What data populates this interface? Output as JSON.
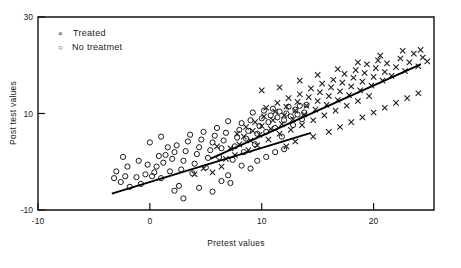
{
  "chart_data": {
    "type": "scatter",
    "title": "",
    "xlabel": "Pretest values",
    "ylabel": "Post test values",
    "xlim": [
      -10,
      25.4
    ],
    "ylim": [
      -10,
      30
    ],
    "xticks": [
      -10,
      0,
      10,
      20
    ],
    "xtick_labels": [
      "-10",
      "0",
      "10",
      "20"
    ],
    "yticks": [
      -10,
      10,
      30
    ],
    "ytick_labels": [
      "-10",
      "10",
      "30"
    ],
    "grid": false,
    "legend_position": "upper-left",
    "legend": [
      {
        "marker": "x",
        "label": "Treated"
      },
      {
        "marker": "o",
        "label": "No treatmet"
      }
    ],
    "series": [
      {
        "name": "No treatmet",
        "marker": "o",
        "color": "#1a1a1a",
        "points": [
          [
            -3.0,
            -2.0
          ],
          [
            -2.6,
            -4.2
          ],
          [
            -2.2,
            -3.0
          ],
          [
            -1.8,
            -5.2
          ],
          [
            -3.2,
            -3.4
          ],
          [
            -2.0,
            -1.0
          ],
          [
            -1.2,
            -3.2
          ],
          [
            -0.8,
            -4.6
          ],
          [
            -0.4,
            -2.6
          ],
          [
            -0.2,
            -0.6
          ],
          [
            0.2,
            -3.0
          ],
          [
            0.4,
            -2.2
          ],
          [
            0.6,
            -1.0
          ],
          [
            0.8,
            1.2
          ],
          [
            1.0,
            -3.4
          ],
          [
            1.2,
            -0.2
          ],
          [
            1.4,
            1.4
          ],
          [
            1.6,
            3.0
          ],
          [
            1.8,
            -2.0
          ],
          [
            2.0,
            0.6
          ],
          [
            2.2,
            2.0
          ],
          [
            2.4,
            3.4
          ],
          [
            2.6,
            -5.0
          ],
          [
            2.8,
            -1.6
          ],
          [
            3.0,
            0.2
          ],
          [
            3.2,
            2.2
          ],
          [
            3.4,
            4.2
          ],
          [
            3.6,
            5.6
          ],
          [
            3.8,
            -2.4
          ],
          [
            4.0,
            -0.4
          ],
          [
            4.2,
            1.6
          ],
          [
            4.4,
            3.0
          ],
          [
            4.6,
            4.6
          ],
          [
            4.8,
            6.2
          ],
          [
            5.0,
            -1.2
          ],
          [
            5.2,
            0.8
          ],
          [
            5.4,
            2.4
          ],
          [
            5.6,
            4.0
          ],
          [
            5.8,
            5.4
          ],
          [
            6.0,
            7.0
          ],
          [
            6.2,
            1.0
          ],
          [
            6.4,
            2.8
          ],
          [
            6.6,
            4.4
          ],
          [
            6.8,
            6.0
          ],
          [
            7.0,
            8.4
          ],
          [
            7.2,
            -4.4
          ],
          [
            7.4,
            0.4
          ],
          [
            7.6,
            3.2
          ],
          [
            7.8,
            5.0
          ],
          [
            8.0,
            6.6
          ],
          [
            8.2,
            8.0
          ],
          [
            8.4,
            2.0
          ],
          [
            8.6,
            4.8
          ],
          [
            8.8,
            6.4
          ],
          [
            9.0,
            8.6
          ],
          [
            9.2,
            10.2
          ],
          [
            9.4,
            3.6
          ],
          [
            9.6,
            5.8
          ],
          [
            9.8,
            7.4
          ],
          [
            10.0,
            9.0
          ],
          [
            10.2,
            10.6
          ],
          [
            10.4,
            6.2
          ],
          [
            10.6,
            8.2
          ],
          [
            10.8,
            9.6
          ],
          [
            11.0,
            11.0
          ],
          [
            11.2,
            7.0
          ],
          [
            11.4,
            9.2
          ],
          [
            11.6,
            10.4
          ],
          [
            11.8,
            5.2
          ],
          [
            12.0,
            8.6
          ],
          [
            12.2,
            10.0
          ],
          [
            12.4,
            11.4
          ],
          [
            12.6,
            9.4
          ],
          [
            12.8,
            7.6
          ],
          [
            13.0,
            10.8
          ],
          [
            13.2,
            9.8
          ],
          [
            13.4,
            11.6
          ],
          [
            13.6,
            8.8
          ],
          [
            13.8,
            10.2
          ],
          [
            14.0,
            11.8
          ],
          [
            0.0,
            4.0
          ],
          [
            1.0,
            5.2
          ],
          [
            -1.0,
            0.2
          ],
          [
            -2.4,
            1.0
          ],
          [
            5.6,
            -6.2
          ],
          [
            3.0,
            -7.6
          ],
          [
            6.4,
            -4.0
          ],
          [
            9.0,
            -1.4
          ],
          [
            9.6,
            0.2
          ],
          [
            10.4,
            1.0
          ],
          [
            11.2,
            2.0
          ],
          [
            12.0,
            2.6
          ],
          [
            2.2,
            -6.0
          ],
          [
            4.4,
            -5.4
          ],
          [
            7.0,
            -2.8
          ],
          [
            8.2,
            -0.8
          ]
        ]
      },
      {
        "name": "Treated",
        "marker": "x",
        "color": "#1a1a1a",
        "points": [
          [
            4.0,
            -2.6
          ],
          [
            4.8,
            -1.4
          ],
          [
            5.6,
            -2.2
          ],
          [
            6.4,
            -1.0
          ],
          [
            6.8,
            0.6
          ],
          [
            7.2,
            2.8
          ],
          [
            7.6,
            1.4
          ],
          [
            8.0,
            3.6
          ],
          [
            8.4,
            5.2
          ],
          [
            8.8,
            2.4
          ],
          [
            9.0,
            4.4
          ],
          [
            9.2,
            6.4
          ],
          [
            9.4,
            8.2
          ],
          [
            9.6,
            3.4
          ],
          [
            9.8,
            5.6
          ],
          [
            10.0,
            7.4
          ],
          [
            10.2,
            9.4
          ],
          [
            10.4,
            11.2
          ],
          [
            10.6,
            4.6
          ],
          [
            10.8,
            6.8
          ],
          [
            11.0,
            8.6
          ],
          [
            11.2,
            10.4
          ],
          [
            11.4,
            12.2
          ],
          [
            11.6,
            5.8
          ],
          [
            11.8,
            7.8
          ],
          [
            12.0,
            9.6
          ],
          [
            12.2,
            11.4
          ],
          [
            12.4,
            13.2
          ],
          [
            12.6,
            6.6
          ],
          [
            12.8,
            8.8
          ],
          [
            13.0,
            10.6
          ],
          [
            13.2,
            12.4
          ],
          [
            13.4,
            14.0
          ],
          [
            13.6,
            7.6
          ],
          [
            13.8,
            9.8
          ],
          [
            14.0,
            11.6
          ],
          [
            14.2,
            13.4
          ],
          [
            14.4,
            15.2
          ],
          [
            14.6,
            8.6
          ],
          [
            14.8,
            10.8
          ],
          [
            15.0,
            12.6
          ],
          [
            15.2,
            14.4
          ],
          [
            15.4,
            16.2
          ],
          [
            15.6,
            9.6
          ],
          [
            15.8,
            11.8
          ],
          [
            16.0,
            13.6
          ],
          [
            16.2,
            15.4
          ],
          [
            16.4,
            17.0
          ],
          [
            16.6,
            10.6
          ],
          [
            16.8,
            12.8
          ],
          [
            17.0,
            14.6
          ],
          [
            17.2,
            16.4
          ],
          [
            17.4,
            18.2
          ],
          [
            17.6,
            11.6
          ],
          [
            17.8,
            13.8
          ],
          [
            18.0,
            15.6
          ],
          [
            18.2,
            17.4
          ],
          [
            18.4,
            19.0
          ],
          [
            18.6,
            12.6
          ],
          [
            18.8,
            14.8
          ],
          [
            19.0,
            16.6
          ],
          [
            19.2,
            18.4
          ],
          [
            19.4,
            20.2
          ],
          [
            19.6,
            13.6
          ],
          [
            19.8,
            15.8
          ],
          [
            20.0,
            17.6
          ],
          [
            20.2,
            19.4
          ],
          [
            20.4,
            21.0
          ],
          [
            20.8,
            16.8
          ],
          [
            21.0,
            18.6
          ],
          [
            21.2,
            20.4
          ],
          [
            21.6,
            17.8
          ],
          [
            22.0,
            19.6
          ],
          [
            22.4,
            21.4
          ],
          [
            22.8,
            18.8
          ],
          [
            23.2,
            20.6
          ],
          [
            23.6,
            22.4
          ],
          [
            24.0,
            19.8
          ],
          [
            24.4,
            21.6
          ],
          [
            24.8,
            20.8
          ],
          [
            6.0,
            3.2
          ],
          [
            7.8,
            5.8
          ],
          [
            8.6,
            7.2
          ],
          [
            12.2,
            3.2
          ],
          [
            13.0,
            4.2
          ],
          [
            14.6,
            5.2
          ],
          [
            16.0,
            6.2
          ],
          [
            17.0,
            7.2
          ],
          [
            18.0,
            8.2
          ],
          [
            19.0,
            9.2
          ],
          [
            20.0,
            10.2
          ],
          [
            21.0,
            11.2
          ],
          [
            22.0,
            12.2
          ],
          [
            23.0,
            13.2
          ],
          [
            24.0,
            14.2
          ],
          [
            10.0,
            14.8
          ],
          [
            11.6,
            15.4
          ],
          [
            13.4,
            16.8
          ],
          [
            15.0,
            18.0
          ],
          [
            16.8,
            19.2
          ],
          [
            18.6,
            20.6
          ],
          [
            20.6,
            22.0
          ],
          [
            22.6,
            23.0
          ],
          [
            24.2,
            23.2
          ]
        ]
      }
    ],
    "fit_lines": [
      {
        "name": "treated-fit",
        "for_series": "Treated",
        "x0": 5.4,
        "y0": 0.6,
        "x1": 24.2,
        "y1": 20.2
      },
      {
        "name": "untreated-fit",
        "for_series": "No treatmet",
        "x0": -3.4,
        "y0": -6.6,
        "x1": 14.4,
        "y1": 6.0
      }
    ]
  }
}
